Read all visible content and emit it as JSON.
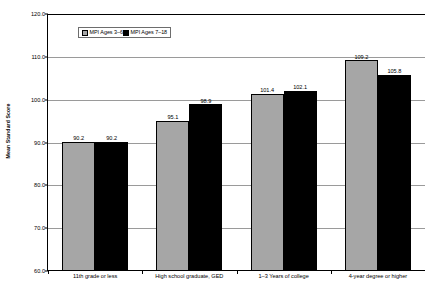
{
  "chart_data": {
    "type": "bar",
    "title": "",
    "xlabel": "",
    "ylabel": "Mean Standard Score",
    "ylim": [
      60.0,
      120.0
    ],
    "ytick_labels": [
      "120.0",
      "110.0",
      "100.0",
      "90.0",
      "80.0",
      "70.0",
      "60.0"
    ],
    "ytick_values": [
      120.0,
      110.0,
      100.0,
      90.0,
      80.0,
      70.0,
      60.0
    ],
    "grid": true,
    "legend_position": "top-center",
    "categories": [
      "11th grade or less",
      "High school graduate, GED",
      "1–3 Years of college",
      "4-year degree or higher"
    ],
    "series": [
      {
        "name": "MPI Ages 3–6",
        "color": "#a6a6a6",
        "values": [
          90.2,
          95.1,
          101.4,
          109.2
        ],
        "labels": [
          "90.2",
          "95.1",
          "101.4",
          "109.2"
        ]
      },
      {
        "name": "MPI Ages 7–18",
        "color": "#000000",
        "values": [
          90.2,
          98.9,
          102.1,
          105.8
        ],
        "labels": [
          "90.2",
          "98.9",
          "102.1",
          "105.8"
        ]
      }
    ]
  }
}
